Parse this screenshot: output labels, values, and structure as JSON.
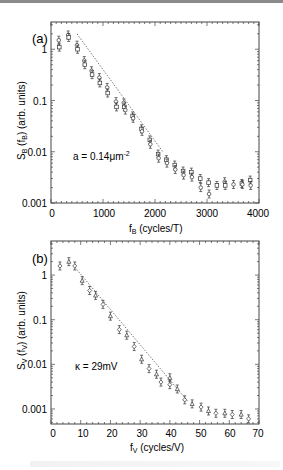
{
  "chart_data": [
    {
      "type": "scatter",
      "panel_label": "(a)",
      "xlabel": "f_B  (cycles/T)",
      "ylabel": "S_B (f_B)  (arb. units)",
      "x_ticks": [
        "0",
        "1000",
        "2000",
        "3000",
        "4000"
      ],
      "y_ticks": [
        "1",
        "0.1",
        "0.01",
        "0.001"
      ],
      "xlim": [
        0,
        4000
      ],
      "ylim": [
        0.001,
        3.4
      ],
      "yscale": "log",
      "annotation": "a = 0.14μm⁻²",
      "fit_line": {
        "style": "dotted",
        "x": [
          500,
          2150
        ],
        "y": [
          2.0,
          0.01
        ]
      },
      "series": [
        {
          "name": "data",
          "marker": "open-circle-and-square with error bars",
          "x": [
            150,
            160,
            330,
            340,
            500,
            510,
            640,
            650,
            780,
            790,
            930,
            940,
            1080,
            1090,
            1250,
            1260,
            1400,
            1410,
            1430,
            1570,
            1580,
            1740,
            1750,
            1900,
            1910,
            2060,
            2070,
            2220,
            2230,
            2380,
            2390,
            2540,
            2550,
            2700,
            2710,
            2870,
            2880,
            3030,
            3040,
            3190,
            3340,
            3350,
            3510,
            3670,
            3680,
            3830,
            3840
          ],
          "y": [
            1.5,
            1.1,
            1.9,
            1.7,
            1.2,
            1.0,
            0.6,
            0.5,
            0.38,
            0.32,
            0.28,
            0.22,
            0.18,
            0.14,
            0.095,
            0.075,
            0.09,
            0.075,
            0.065,
            0.05,
            0.045,
            0.028,
            0.025,
            0.017,
            0.014,
            0.009,
            0.0075,
            0.007,
            0.006,
            0.0055,
            0.0045,
            0.0042,
            0.0035,
            0.004,
            0.0032,
            0.003,
            0.002,
            0.0025,
            0.0015,
            0.0022,
            0.0026,
            0.0022,
            0.0023,
            0.0024,
            0.0023,
            0.0028,
            0.0022
          ]
        }
      ]
    },
    {
      "type": "scatter",
      "panel_label": "(b)",
      "xlabel": "f_V  (cycles/V)",
      "ylabel": "S_V (f_V)  (arb. units)",
      "x_ticks": [
        "0",
        "10",
        "20",
        "30",
        "40",
        "50",
        "60",
        "70"
      ],
      "y_ticks": [
        "1",
        "0.1",
        "0.01",
        "0.001"
      ],
      "xlim": [
        0,
        70
      ],
      "ylim": [
        0.00046,
        5.8
      ],
      "yscale": "log",
      "annotation": "κ = 29mV",
      "fit_line": {
        "style": "dotted",
        "x": [
          8,
          46
        ],
        "y": [
          1.5,
          0.0015
        ]
      },
      "series": [
        {
          "name": "data",
          "marker": "open-diamond-and-triangle with error bars",
          "x": [
            3,
            6,
            8,
            10.5,
            13,
            15,
            17.5,
            20,
            23,
            25.5,
            28,
            30.5,
            33,
            35.5,
            37,
            40,
            40,
            42.5,
            45,
            47.5,
            50.5,
            53,
            55.5,
            58.5,
            61,
            64,
            66.5
          ],
          "y": [
            1.6,
            2.0,
            1.6,
            0.75,
            0.45,
            0.35,
            0.22,
            0.12,
            0.06,
            0.045,
            0.025,
            0.013,
            0.008,
            0.006,
            0.004,
            0.005,
            0.0035,
            0.0028,
            0.0016,
            0.0013,
            0.0011,
            0.0009,
            0.0008,
            0.0008,
            0.00075,
            0.00075,
            0.0006
          ]
        }
      ]
    }
  ],
  "panels": {
    "a": {
      "label": "(a)",
      "x_axis_title_main": "f",
      "x_axis_title_sub": "B",
      "x_axis_title_rest": "  (cycles/T)",
      "y_axis_title": "S_B (f_B)  (arb. units)",
      "annotation_main": "a",
      "annotation_rest": " = 0.14μm",
      "annotation_sup": "-2",
      "x_ticks": [
        "0",
        "1000",
        "2000",
        "3000",
        "4000"
      ],
      "y_ticks": [
        "1",
        "0.1",
        "0.01",
        "0.001"
      ]
    },
    "b": {
      "label": "(b)",
      "x_axis_title_main": "f",
      "x_axis_title_sub": "V",
      "x_axis_title_rest": "  (cycles/V)",
      "y_axis_title": "S_V (f_V)  (arb. units)",
      "annotation": "κ = 29mV",
      "x_ticks": [
        "0",
        "10",
        "20",
        "30",
        "40",
        "50",
        "60",
        "70"
      ],
      "y_ticks": [
        "1",
        "0.1",
        "0.01",
        "0.001"
      ]
    }
  },
  "colors": {
    "ink": "#222222",
    "frame": "#444444",
    "background": "#ffffff"
  }
}
